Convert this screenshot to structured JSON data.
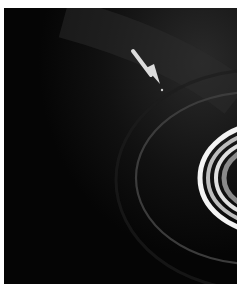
{
  "image": {
    "subject": "Saturn rings with small moon indicated by arrow",
    "colors": {
      "background": "#050505",
      "ring_bright": "#f2f2f2",
      "ring_faint": "#3a3a3a",
      "arrow": "#dcdcdc",
      "border": "#ffffff"
    },
    "annotations": [
      {
        "type": "arrow",
        "pointing_to": "moon"
      }
    ]
  },
  "caption": {
    "text": ""
  }
}
